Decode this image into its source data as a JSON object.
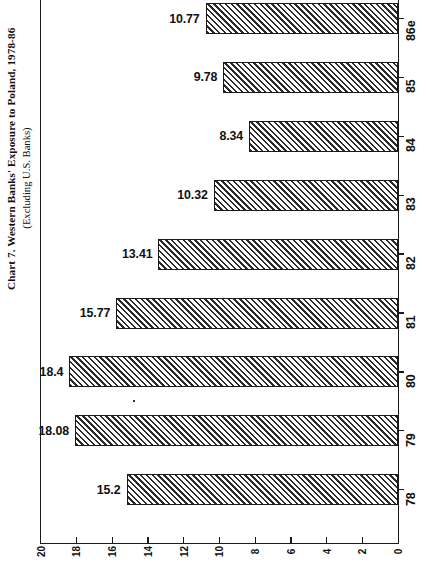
{
  "title": {
    "main": "Chart 7. Western Banks' Exposure to Poland, 1978-86",
    "sub": "(Excluding U.S. Banks)"
  },
  "axes": {
    "x_ticks": [
      "20",
      "18",
      "16",
      "14",
      "12",
      "10",
      "8",
      "6",
      "4",
      "2",
      "0"
    ],
    "y_ticks": [
      "86e",
      "85",
      "84",
      "83",
      "82",
      "81",
      "80",
      "79",
      "78"
    ]
  },
  "chart_data": {
    "type": "bar",
    "orientation": "horizontal",
    "title": "Chart 7. Western Banks' Exposure to Poland, 1978-86",
    "subtitle": "(Excluding U.S. Banks)",
    "xlabel": "",
    "ylabel": "",
    "categories": [
      "78",
      "79",
      "80",
      "81",
      "82",
      "83",
      "84",
      "85",
      "86e"
    ],
    "values": [
      15.2,
      18.08,
      18.4,
      15.77,
      13.41,
      10.32,
      8.34,
      9.78,
      10.77
    ],
    "data_labels": [
      "15.2",
      "18.08",
      "18.4",
      "15.77",
      "13.41",
      "10.32",
      "8.34",
      "9.78",
      "10.77"
    ],
    "xlim": [
      0,
      20
    ],
    "xticks": [
      0,
      2,
      4,
      6,
      8,
      10,
      12,
      14,
      16,
      18,
      20
    ],
    "x_axis_direction": "reversed",
    "grid": false,
    "legend": false,
    "bar_fill": "diagonal-hatch",
    "bar_edge_color": "#1a1a1a",
    "background": "#ffffff"
  },
  "bars": [
    {
      "year": "86e",
      "value": 10.77,
      "label": "10.77"
    },
    {
      "year": "85",
      "value": 9.78,
      "label": "9.78"
    },
    {
      "year": "84",
      "value": 8.34,
      "label": "8.34"
    },
    {
      "year": "83",
      "value": 10.32,
      "label": "10.32"
    },
    {
      "year": "82",
      "value": 13.41,
      "label": "13.41"
    },
    {
      "year": "81",
      "value": 15.77,
      "label": "15.77"
    },
    {
      "year": "80",
      "value": 18.4,
      "label": "18.4"
    },
    {
      "year": "79",
      "value": 18.08,
      "label": "18.08"
    },
    {
      "year": "78",
      "value": 15.2,
      "label": "15.2"
    }
  ]
}
